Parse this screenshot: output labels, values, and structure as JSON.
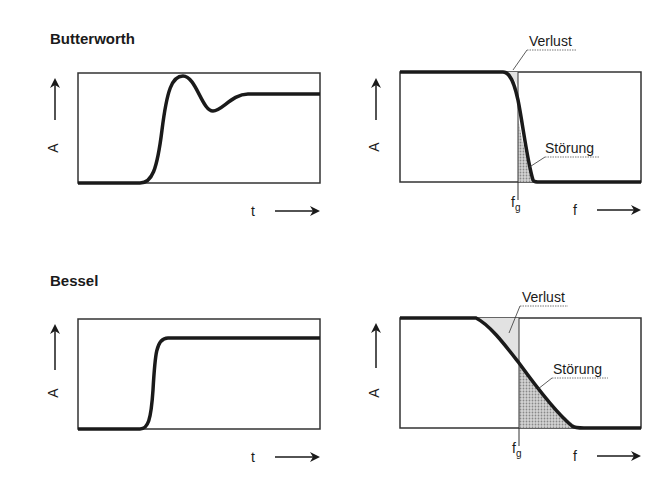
{
  "panels": {
    "butterworth": {
      "title": "Butterworth",
      "time": {
        "y_label": "A",
        "x_label": "t"
      },
      "freq": {
        "y_label": "A",
        "x_label": "f",
        "cutoff_label": "f",
        "cutoff_sub": "g",
        "loss_label": "Verlust",
        "interference_label": "Störung"
      }
    },
    "bessel": {
      "title": "Bessel",
      "time": {
        "y_label": "A",
        "x_label": "t"
      },
      "freq": {
        "y_label": "A",
        "x_label": "f",
        "cutoff_label": "f",
        "cutoff_sub": "g",
        "loss_label": "Verlust",
        "interference_label": "Störung"
      }
    }
  },
  "colors": {
    "line": "#1a1a1a",
    "shade": "#b8b8b8",
    "background": "#ffffff"
  }
}
